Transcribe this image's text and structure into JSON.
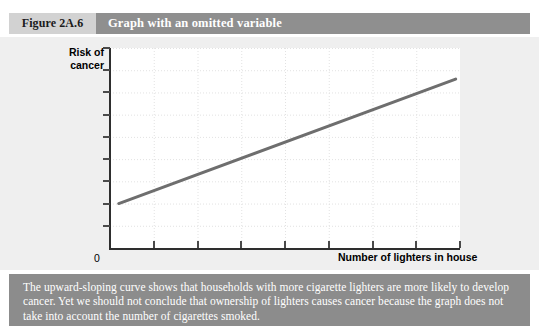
{
  "header": {
    "figure_number": "Figure 2A.6",
    "figure_title": "Graph with an omitted variable"
  },
  "chart_data": {
    "type": "line",
    "title": "Graph with an omitted variable",
    "xlabel": "Number of lighters in house",
    "ylabel": "Risk of cancer",
    "origin_label": "0",
    "grid": true,
    "legend": null,
    "xlim": [
      0,
      8
    ],
    "ylim": [
      0,
      9
    ],
    "x_ticks": [
      1,
      2,
      3,
      4,
      5,
      6,
      7,
      8
    ],
    "y_ticks": [
      1,
      2,
      3,
      4,
      5,
      6,
      7,
      8,
      9
    ],
    "series": [
      {
        "name": "Risk of cancer vs. lighters",
        "x": [
          0.2,
          7.9
        ],
        "values": [
          2.0,
          7.6
        ],
        "color": "#6e6e6e",
        "line_width": 3
      }
    ],
    "annotation": "Upward-sloping straight line"
  },
  "caption": {
    "text": "The upward-sloping curve shows that households with more cigarette lighters are more likely to develop cancer. Yet we should not conclude that ownership of lighters causes cancer because the graph does not take into account the number of cigarettes smoked."
  },
  "colors": {
    "page_background": "#ffffff",
    "panel_background": "#efefef",
    "plot_background": "#ffffff",
    "figure_number_background": "#d2d2d2",
    "title_background": "#8f8f8f",
    "caption_background": "#8c8c8c",
    "curve": "#6e6e6e",
    "axis": "#2e2e2e",
    "grid": "#e2e2e2"
  }
}
